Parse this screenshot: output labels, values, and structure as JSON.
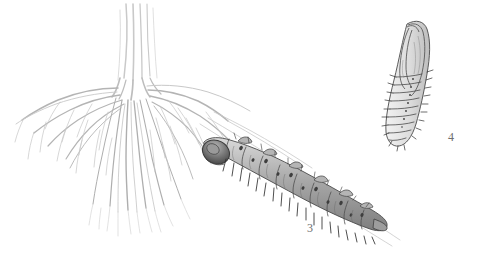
{
  "plate": {
    "background_color": "#ffffff",
    "width": 487,
    "height": 261,
    "medium": "pencil-illustration",
    "ink_color": "#8a8a8a",
    "dark_ink_color": "#3a3a3a"
  },
  "figures": [
    {
      "id": "root-system",
      "name": "plant-root-system",
      "label": "",
      "description": "taproot and fibrous roots of a plant drawn in pencil"
    },
    {
      "id": "larva",
      "name": "larva",
      "label": "3",
      "label_x": 307,
      "label_y": 222,
      "description": "segmented larva with dark head capsule, dorsal spots and bristles, lying diagonally among roots"
    },
    {
      "id": "pupa",
      "name": "pupa",
      "label": "4",
      "label_x": 448,
      "label_y": 131,
      "description": "pupa with wing cases and ridged segmented abdomen"
    }
  ],
  "labels": {
    "larva_number": "3",
    "pupa_number": "4"
  }
}
